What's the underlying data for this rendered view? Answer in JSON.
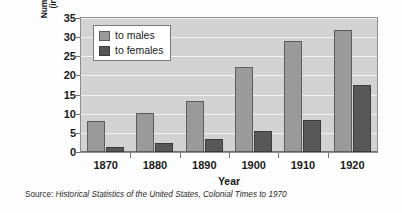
{
  "chart_data": {
    "type": "bar",
    "title": "",
    "xlabel": "Year",
    "ylabel": "Number of Degrees (in thousands)",
    "ylabel_line1": "Number of Degrees",
    "ylabel_line2": "(in thousands)",
    "categories": [
      "1870",
      "1880",
      "1890",
      "1900",
      "1910",
      "1920"
    ],
    "series": [
      {
        "name": "to males",
        "color": "#9a9a9a",
        "values": [
          8.1,
          10.3,
          13.2,
          22.2,
          29.0,
          32.0
        ]
      },
      {
        "name": "to females",
        "color": "#585858",
        "values": [
          1.4,
          2.4,
          3.4,
          5.5,
          8.3,
          17.5
        ]
      }
    ],
    "ylim": [
      0,
      35
    ],
    "ytick_step": 5,
    "yticks": [
      "0",
      "5",
      "10",
      "15",
      "20",
      "25",
      "30",
      "35"
    ],
    "grid": true,
    "grid_color": "#f2f2f2",
    "legend_position": "top-left",
    "plot_background": "#d2d2d2"
  },
  "source": {
    "label": "Source: ",
    "title": "Historical Statistics of the United States, Colonial Times to 1970"
  }
}
